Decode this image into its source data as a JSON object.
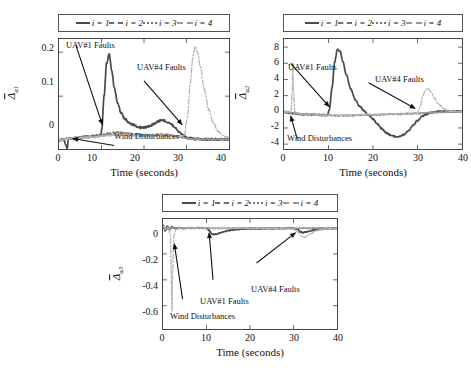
{
  "figure": {
    "background": "#ffffff",
    "line_colors": {
      "i1": "#4a4a4a",
      "i2": "#6e6e6e",
      "i3": "#9a9a9a",
      "i4": "#b5b5b5"
    },
    "annotation_color": "#111111"
  },
  "legend": {
    "items": [
      {
        "label": "i = 1",
        "style": "solid"
      },
      {
        "label": "i = 2",
        "style": "dashed"
      },
      {
        "label": "i = 3",
        "style": "dotted"
      },
      {
        "label": "i = 4",
        "style": "dashdot"
      }
    ]
  },
  "annotations": {
    "uav1": "UAV#1 Faults",
    "uav4": "UAV#4 Faults",
    "wind": "Wind Disturbances"
  },
  "chart_data": [
    {
      "id": "panel-a",
      "type": "line",
      "title": "",
      "xlabel": "Time (seconds)",
      "ylabel": "Δ̄a1",
      "ylabel_base": "Δ",
      "ylabel_sub": "a1",
      "xlim": [
        0,
        40
      ],
      "ylim": [
        -0.02,
        0.23
      ],
      "xticks": [
        0,
        10,
        20,
        30,
        40
      ],
      "xtick_labels": [
        "0",
        "10",
        "20",
        "30",
        "40"
      ],
      "yticks": [
        0,
        0.1,
        0.2
      ],
      "ytick_labels": [
        "0",
        "0.1",
        "0.2"
      ],
      "grid": false,
      "legend_position": "above",
      "annotations": [
        {
          "text": "UAV#1 Faults",
          "x": 4.0,
          "y": 0.215,
          "arrow_to_x": 10.2,
          "arrow_to_y": 0.035
        },
        {
          "text": "UAV#4 Faults",
          "x": 20.0,
          "y": 0.135,
          "arrow_to_x": 29.0,
          "arrow_to_y": 0.035
        },
        {
          "text": "Wind Disturbances",
          "x": 13.0,
          "y": -0.012,
          "arrow_to_x": 3.2,
          "arrow_to_y": 0.004
        }
      ],
      "series": [
        {
          "name": "i = 1",
          "style": "solid",
          "color": "#4a4a4a",
          "x": [
            0,
            1,
            2,
            2.2,
            3,
            4,
            5,
            6,
            7,
            8,
            9,
            9.9,
            10.1,
            10.6,
            11.2,
            11.8,
            12.4,
            13,
            13.8,
            14.6,
            15.5,
            16.5,
            17.5,
            18.5,
            19.5,
            20.5,
            21.5,
            22.5,
            23.3,
            24.2,
            25,
            25.8,
            26.6,
            27.4,
            28.2,
            29,
            30,
            31,
            32,
            34,
            36,
            38,
            40
          ],
          "y": [
            0,
            0.002,
            -0.018,
            0.004,
            0.003,
            0.004,
            0.006,
            0.008,
            0.007,
            0.009,
            0.01,
            0.012,
            0.03,
            0.1,
            0.175,
            0.195,
            0.16,
            0.12,
            0.085,
            0.062,
            0.048,
            0.04,
            0.035,
            0.03,
            0.028,
            0.03,
            0.033,
            0.038,
            0.043,
            0.046,
            0.044,
            0.04,
            0.035,
            0.028,
            0.02,
            0.012,
            0.006,
            0.004,
            0.003,
            0.002,
            0.002,
            0.002,
            0.002
          ]
        },
        {
          "name": "i = 2",
          "style": "dashed",
          "color": "#6e6e6e",
          "x": [
            0,
            2,
            4,
            6,
            8,
            10,
            12,
            14,
            16,
            18,
            20,
            22,
            24,
            26,
            28,
            30,
            32,
            34,
            36,
            38,
            40
          ],
          "y": [
            0,
            0.004,
            0.006,
            0.008,
            0.009,
            0.012,
            0.016,
            0.018,
            0.016,
            0.013,
            0.012,
            0.012,
            0.013,
            0.012,
            0.009,
            0.005,
            0.003,
            0.002,
            0.002,
            0.002,
            0.002
          ]
        },
        {
          "name": "i = 3",
          "style": "dotted",
          "color": "#9a9a9a",
          "x": [
            0,
            2,
            4,
            6,
            8,
            10,
            12,
            14,
            16,
            18,
            20,
            22,
            24,
            26,
            28,
            30,
            32,
            34,
            36,
            38,
            40
          ],
          "y": [
            0,
            0.003,
            0.005,
            0.007,
            0.008,
            0.01,
            0.013,
            0.014,
            0.013,
            0.011,
            0.01,
            0.011,
            0.012,
            0.011,
            0.008,
            0.004,
            0.003,
            0.002,
            0.002,
            0.002,
            0.002
          ]
        },
        {
          "name": "i = 4",
          "style": "dashdot",
          "color": "#b5b5b5",
          "x": [
            0,
            2,
            4,
            6,
            8,
            10,
            12,
            14,
            16,
            18,
            20,
            22,
            24,
            26,
            28,
            29.5,
            30.2,
            30.9,
            31.5,
            32,
            32.6,
            33.3,
            34.2,
            35.2,
            36.3,
            37.5,
            38.7,
            40
          ],
          "y": [
            0,
            0.003,
            0.005,
            0.006,
            0.007,
            0.009,
            0.011,
            0.012,
            0.011,
            0.01,
            0.009,
            0.01,
            0.011,
            0.009,
            0.007,
            0.012,
            0.05,
            0.13,
            0.19,
            0.212,
            0.2,
            0.165,
            0.115,
            0.07,
            0.04,
            0.02,
            0.01,
            0.005
          ]
        }
      ]
    },
    {
      "id": "panel-b",
      "type": "line",
      "title": "",
      "xlabel": "Time (seconds)",
      "ylabel": "Δ̄a2",
      "ylabel_base": "Δ",
      "ylabel_sub": "a2",
      "xlim": [
        0,
        40
      ],
      "ylim": [
        -4.6,
        9.0
      ],
      "xticks": [
        0,
        10,
        20,
        30,
        40
      ],
      "xtick_labels": [
        "0",
        "10",
        "20",
        "30",
        "40"
      ],
      "yticks": [
        -4,
        -2,
        0,
        2,
        4,
        6,
        8
      ],
      "ytick_labels": [
        "-4",
        "-2",
        "0",
        "2",
        "4",
        "6",
        "8"
      ],
      "grid": false,
      "legend_position": "above",
      "annotations": [
        {
          "text": "UAV#1 Faults",
          "x": 1.5,
          "y": 6.0,
          "arrow_to_x": 10.2,
          "arrow_to_y": 0.6
        },
        {
          "text": "UAV#4 Faults",
          "x": 19.0,
          "y": 3.6,
          "arrow_to_x": 29.5,
          "arrow_to_y": 0.4
        },
        {
          "text": "Wind Disturbances",
          "x": 3.0,
          "y": -3.4,
          "arrow_to_x": 1.5,
          "arrow_to_y": -0.5
        }
      ],
      "series": [
        {
          "name": "i = 1",
          "style": "solid",
          "color": "#4a4a4a",
          "x": [
            0,
            1,
            1.8,
            2.0,
            2.3,
            3,
            4,
            5,
            6,
            7,
            8,
            9,
            9.8,
            10.2,
            10.8,
            11.4,
            12,
            12.6,
            13.2,
            14,
            15,
            16,
            17,
            18,
            19,
            20,
            21,
            22,
            23,
            24,
            25,
            26,
            27,
            28,
            29,
            30,
            31,
            32,
            33,
            34,
            35,
            36,
            37,
            38,
            39,
            40
          ],
          "y": [
            0,
            -0.1,
            -0.2,
            -0.2,
            -0.2,
            -0.25,
            -0.3,
            -0.3,
            -0.35,
            -0.35,
            -0.4,
            -0.4,
            -0.4,
            0.3,
            3.0,
            6.2,
            7.7,
            7.5,
            6.3,
            4.6,
            2.8,
            1.5,
            0.7,
            0.1,
            -0.4,
            -0.9,
            -1.5,
            -2.1,
            -2.6,
            -2.9,
            -3.05,
            -3.05,
            -2.8,
            -2.3,
            -1.7,
            -1.1,
            -0.6,
            -0.3,
            -0.1,
            0.0,
            0.05,
            0.05,
            0.05,
            0.05,
            0.05,
            0.05
          ]
        },
        {
          "name": "i = 2",
          "style": "dashed",
          "color": "#6e6e6e",
          "x": [
            0,
            2,
            4,
            6,
            8,
            10,
            12,
            14,
            16,
            18,
            20,
            22,
            24,
            26,
            28,
            30,
            32,
            34,
            36,
            38,
            40
          ],
          "y": [
            0,
            -0.2,
            -0.3,
            -0.35,
            -0.4,
            -0.45,
            -0.5,
            -0.5,
            -0.45,
            -0.4,
            -0.4,
            -0.35,
            -0.3,
            -0.3,
            -0.25,
            -0.2,
            -0.15,
            -0.1,
            -0.05,
            0,
            0
          ]
        },
        {
          "name": "i = 3",
          "style": "dotted",
          "color": "#9a9a9a",
          "x": [
            0,
            2,
            4,
            6,
            8,
            10,
            12,
            14,
            16,
            18,
            20,
            22,
            24,
            26,
            28,
            30,
            32,
            34,
            36,
            38,
            40
          ],
          "y": [
            0,
            -0.15,
            -0.25,
            -0.3,
            -0.35,
            -0.4,
            -0.42,
            -0.42,
            -0.4,
            -0.35,
            -0.35,
            -0.3,
            -0.28,
            -0.25,
            -0.2,
            -0.18,
            -0.12,
            -0.08,
            -0.04,
            0,
            0
          ]
        },
        {
          "name": "i = 4",
          "style": "dashdot",
          "color": "#b5b5b5",
          "x": [
            0,
            1.6,
            1.9,
            2.0,
            2.1,
            2.4,
            3,
            4,
            6,
            8,
            10,
            12,
            14,
            16,
            18,
            20,
            22,
            24,
            26,
            28,
            30,
            30.6,
            31.2,
            31.8,
            32.3,
            33,
            33.8,
            34.8,
            36,
            37.2,
            38.5,
            40
          ],
          "y": [
            0,
            0,
            3.0,
            6.1,
            3.0,
            0,
            -0.2,
            -0.3,
            -0.35,
            -0.4,
            -0.45,
            -0.45,
            -0.42,
            -0.4,
            -0.38,
            -0.35,
            -0.32,
            -0.3,
            -0.28,
            -0.25,
            -0.2,
            0.7,
            2.0,
            2.7,
            2.9,
            2.5,
            1.7,
            0.9,
            0.35,
            0.1,
            0.02,
            0
          ]
        }
      ]
    },
    {
      "id": "panel-c",
      "type": "line",
      "title": "",
      "xlabel": "Time (seconds)",
      "ylabel": "Δ̄a3",
      "ylabel_base": "Δ",
      "ylabel_sub": "a3",
      "xlim": [
        0,
        40
      ],
      "ylim": [
        -0.78,
        0.07
      ],
      "xticks": [
        0,
        10,
        20,
        30,
        40
      ],
      "xtick_labels": [
        "0",
        "10",
        "20",
        "30",
        "40"
      ],
      "yticks": [
        0,
        -0.2,
        -0.4,
        -0.6
      ],
      "ytick_labels": [
        "0",
        "-0.2",
        "-0.4",
        "-0.6"
      ],
      "grid": false,
      "legend_position": "above",
      "annotations": [
        {
          "text": "UAV#1 Faults",
          "x": 11.5,
          "y": -0.4,
          "arrow_to_x": 10.6,
          "arrow_to_y": -0.035
        },
        {
          "text": "UAV#4 Faults",
          "x": 21.5,
          "y": -0.27,
          "arrow_to_x": 30.5,
          "arrow_to_y": -0.035
        },
        {
          "text": "Wind Disturbances",
          "x": 4.5,
          "y": -0.55,
          "arrow_to_x": 2.6,
          "arrow_to_y": -0.12
        }
      ],
      "series": [
        {
          "name": "i = 1",
          "style": "solid",
          "color": "#4a4a4a",
          "x": [
            0,
            0.5,
            1,
            1.5,
            2,
            3,
            4,
            5,
            6,
            7,
            8,
            9,
            10,
            10.6,
            11.2,
            11.8,
            12.5,
            13.2,
            14,
            15,
            16,
            17,
            18,
            19,
            20,
            22,
            24,
            26,
            28,
            30,
            31,
            31.6,
            32.2,
            33,
            34,
            35,
            36,
            38,
            40
          ],
          "y": [
            0.02,
            -0.02,
            0.015,
            -0.012,
            0.008,
            -0.004,
            0.002,
            -0.002,
            0.001,
            -0.001,
            0.001,
            0,
            0,
            -0.018,
            -0.045,
            -0.05,
            -0.045,
            -0.035,
            -0.028,
            -0.02,
            -0.014,
            -0.01,
            -0.008,
            -0.006,
            -0.005,
            -0.004,
            -0.003,
            -0.003,
            -0.002,
            -0.002,
            -0.012,
            -0.03,
            -0.035,
            -0.03,
            -0.02,
            -0.012,
            -0.008,
            -0.004,
            -0.003
          ]
        },
        {
          "name": "i = 2",
          "style": "dashed",
          "color": "#6e6e6e",
          "x": [
            0,
            1,
            2,
            4,
            6,
            8,
            10,
            12,
            14,
            16,
            18,
            20,
            24,
            28,
            32,
            36,
            40
          ],
          "y": [
            0.01,
            -0.008,
            0.004,
            -0.002,
            0.001,
            0,
            0,
            -0.002,
            -0.002,
            -0.001,
            -0.001,
            -0.001,
            -0.001,
            -0.001,
            -0.002,
            -0.001,
            -0.001
          ]
        },
        {
          "name": "i = 3",
          "style": "dotted",
          "color": "#9a9a9a",
          "x": [
            0,
            1,
            2,
            4,
            6,
            8,
            10,
            12,
            14,
            16,
            18,
            20,
            24,
            28,
            32,
            36,
            40
          ],
          "y": [
            0.008,
            -0.006,
            0.003,
            -0.002,
            0.001,
            0,
            0,
            -0.001,
            -0.002,
            -0.001,
            -0.001,
            -0.001,
            -0.001,
            -0.001,
            -0.002,
            -0.001,
            -0.001
          ]
        },
        {
          "name": "i = 4",
          "style": "dashdot",
          "color": "#b5b5b5",
          "x": [
            0,
            0.6,
            1.2,
            1.7,
            1.95,
            2.05,
            2.2,
            2.5,
            3,
            4,
            6,
            8,
            10,
            12,
            14,
            16,
            18,
            20,
            24,
            28,
            30,
            31,
            31.8,
            32.5,
            33.2,
            34,
            35,
            36,
            37.5,
            39,
            40
          ],
          "y": [
            0.015,
            -0.012,
            0.01,
            -0.05,
            -0.45,
            -0.72,
            -0.35,
            -0.06,
            -0.01,
            0,
            0,
            0,
            0,
            -0.004,
            -0.004,
            -0.003,
            -0.002,
            -0.002,
            -0.002,
            -0.002,
            -0.008,
            -0.03,
            -0.062,
            -0.07,
            -0.06,
            -0.042,
            -0.025,
            -0.014,
            -0.006,
            -0.003,
            -0.002
          ]
        }
      ]
    }
  ]
}
